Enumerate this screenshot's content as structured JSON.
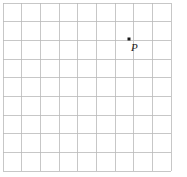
{
  "figure": {
    "width": 187,
    "height": 177,
    "background_color": "#ffffff",
    "caption": ""
  },
  "grid": {
    "line_color": "#b9b9b9",
    "line_width": 0.8,
    "columns": 9,
    "rows": 9,
    "cell_size": 18.7,
    "origin_x": 3,
    "origin_y": 3,
    "x_lines": [
      3,
      21.7,
      40.4,
      59.1,
      77.8,
      96.5,
      115.2,
      133.9,
      152.6,
      171.3
    ],
    "y_lines": [
      3,
      21.7,
      40.4,
      59.1,
      77.8,
      96.5,
      115.2,
      133.9,
      152.6,
      171.3
    ]
  },
  "points": [
    {
      "label": "P",
      "dot_color": "#1a1a1a",
      "dot_size": 3,
      "x": 129,
      "y": 39,
      "grid_col": 7,
      "grid_row": 2,
      "label_x": 131,
      "label_y": 42
    }
  ],
  "chart_data": {
    "type": "scatter",
    "title": "",
    "xlabel": "",
    "ylabel": "",
    "grid": true,
    "legend": "none",
    "xlim": [
      0,
      9
    ],
    "ylim": [
      0,
      9
    ],
    "categories": [],
    "series": [
      {
        "name": "P",
        "points": [
          {
            "x": 7,
            "y": 7,
            "label": "P"
          }
        ]
      }
    ],
    "annotations": [
      {
        "text": "P",
        "x": 7,
        "y": 7,
        "position": "below-right"
      }
    ]
  }
}
